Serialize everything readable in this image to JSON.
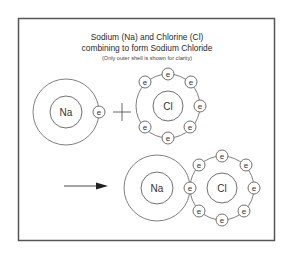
{
  "diagram": {
    "title_line1": "Sodium (Na) and Chlorine (Cl)",
    "title_line2": "combining to form Sodium Chloride",
    "subtitle": "(Only outer shell is shown for clarity)",
    "operator": "plus",
    "result_arrow": "right-arrow",
    "electron_label": "e",
    "before": {
      "sodium": {
        "symbol": "Na",
        "outer_electrons": 1
      },
      "chlorine": {
        "symbol": "Cl",
        "outer_electrons": 7
      }
    },
    "after": {
      "sodium": {
        "symbol": "Na",
        "outer_electrons": 0
      },
      "chlorine": {
        "symbol": "Cl",
        "outer_electrons": 8
      }
    },
    "colors": {
      "line": "#606060",
      "frame": "#555555",
      "text": "#333333"
    }
  }
}
